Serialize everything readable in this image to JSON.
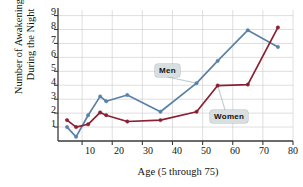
{
  "chart_data": {
    "type": "line",
    "title": "",
    "xlabel": "Age (5 through 75)",
    "ylabel": "Number of Awakenings\nDuring the Night",
    "xlim": [
      2,
      80
    ],
    "ylim": [
      0,
      9.4
    ],
    "xticks": [
      10,
      20,
      30,
      40,
      50,
      60,
      70,
      80
    ],
    "yticks": [
      1,
      2,
      3,
      4,
      5,
      6,
      7,
      8,
      9
    ],
    "grid": true,
    "legend_position": "inline-callouts",
    "series": [
      {
        "name": "Men",
        "color": "#5b82a6",
        "x": [
          5,
          8,
          12,
          16,
          18,
          25,
          36,
          48,
          55,
          65,
          75
        ],
        "y": [
          1.0,
          0.3,
          1.85,
          3.2,
          2.85,
          3.3,
          2.1,
          4.15,
          5.75,
          7.95,
          6.75
        ]
      },
      {
        "name": "Women",
        "color": "#8b1f33",
        "x": [
          5,
          8,
          12,
          16,
          18,
          25,
          36,
          48,
          55,
          65,
          75
        ],
        "y": [
          1.5,
          1.0,
          1.2,
          2.05,
          1.85,
          1.4,
          1.5,
          2.1,
          3.98,
          4.05,
          8.15
        ]
      }
    ],
    "annotations": [
      {
        "label": "Men",
        "target_x": 48,
        "target_y": 4.15
      },
      {
        "label": "Women",
        "target_x": 55,
        "target_y": 3.98
      }
    ]
  },
  "axis": {
    "y_tick_labels": [
      "9",
      "8",
      "7",
      "6",
      "5",
      "4",
      "3",
      "2",
      "1"
    ],
    "x_tick_labels": [
      "10",
      "20",
      "30",
      "40",
      "50",
      "60",
      "70",
      "80"
    ]
  },
  "callouts": {
    "men_label": "Men",
    "women_label": "Women"
  }
}
